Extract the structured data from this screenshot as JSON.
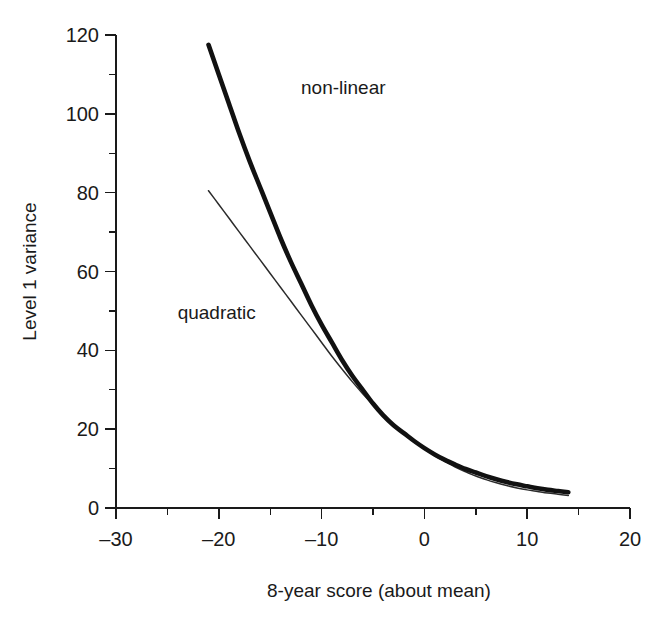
{
  "chart_data": {
    "type": "line",
    "title": "",
    "xlabel": "8-year score (about mean)",
    "ylabel": "Level 1 variance",
    "xlim": [
      -30,
      20
    ],
    "ylim": [
      0,
      120
    ],
    "xticks": [
      -30,
      -20,
      -10,
      0,
      10,
      20
    ],
    "xtick_labels": [
      "–30",
      "–20",
      "–10",
      "0",
      "10",
      "20"
    ],
    "xminor_ticks": [
      -25,
      -15,
      -5,
      5,
      15
    ],
    "yticks": [
      0,
      20,
      40,
      60,
      80,
      100,
      120
    ],
    "ytick_labels": [
      "0",
      "20",
      "40",
      "60",
      "80",
      "100",
      "120"
    ],
    "grid": false,
    "legend_position": "inline-annotations",
    "series": [
      {
        "name": "non-linear",
        "style": "thick-solid",
        "color": "#111111",
        "label_x": -12,
        "label_y": 105,
        "x": [
          -21,
          -20,
          -19,
          -18,
          -17,
          -16,
          -15,
          -14,
          -13,
          -12,
          -11,
          -10,
          -9,
          -8,
          -7,
          -6,
          -5,
          -4,
          -3,
          -2,
          -1,
          0,
          1,
          2,
          3,
          4,
          5,
          6,
          7,
          8,
          9,
          10,
          11,
          12,
          13,
          14
        ],
        "y": [
          117.5,
          110.0,
          102.5,
          95.0,
          88.0,
          81.5,
          75.0,
          68.5,
          62.5,
          57.0,
          51.5,
          46.5,
          42.0,
          37.5,
          33.5,
          30.0,
          26.5,
          23.5,
          21.0,
          19.0,
          17.0,
          15.2,
          13.6,
          12.2,
          11.0,
          9.9,
          9.0,
          8.1,
          7.3,
          6.6,
          6.0,
          5.5,
          5.0,
          4.6,
          4.3,
          4.0
        ]
      },
      {
        "name": "quadratic",
        "style": "thin-solid",
        "color": "#2b2b2b",
        "label_x": -24,
        "label_y": 48,
        "x": [
          -21,
          -20,
          -19,
          -18,
          -17,
          -16,
          -15,
          -14,
          -13,
          -12,
          -11,
          -10,
          -9,
          -8,
          -7,
          -6,
          -5,
          -4,
          -3,
          -2,
          -1,
          0,
          1,
          2,
          3,
          4,
          5,
          6,
          7,
          8,
          9,
          10,
          11,
          12,
          13,
          14
        ],
        "y": [
          80.5,
          77.0,
          73.5,
          70.0,
          66.5,
          63.0,
          59.5,
          56.0,
          52.5,
          49.0,
          45.5,
          42.0,
          38.5,
          35.2,
          32.0,
          29.0,
          26.2,
          23.5,
          21.0,
          18.8,
          16.8,
          15.0,
          13.3,
          11.8,
          10.4,
          9.2,
          8.1,
          7.2,
          6.4,
          5.7,
          5.1,
          4.6,
          4.2,
          3.8,
          3.5,
          3.2
        ]
      }
    ]
  }
}
